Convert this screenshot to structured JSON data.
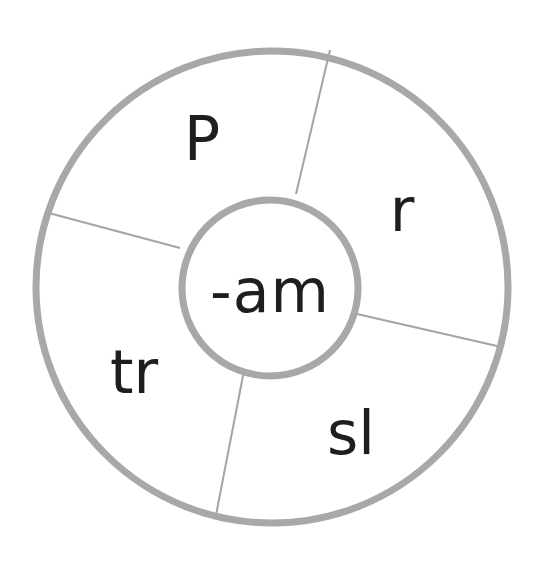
{
  "worksheet": {
    "type": "word-family wheel",
    "center": {
      "text": "-am",
      "x": 270,
      "y": 291
    },
    "segments": [
      {
        "text": "P",
        "x": 202,
        "y": 139
      },
      {
        "text": "r",
        "x": 402,
        "y": 210
      },
      {
        "text": "sl",
        "x": 351,
        "y": 433
      },
      {
        "text": "tr",
        "x": 134,
        "y": 372
      }
    ]
  },
  "style": {
    "ring_color": "#a8a8a8",
    "divider_color": "#a4a4a4",
    "text_color": "#1e1e1e",
    "background": "#ffffff"
  }
}
